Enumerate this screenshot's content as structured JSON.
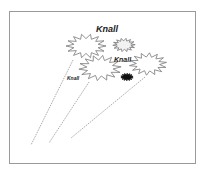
{
  "diagram": {
    "labels": [
      {
        "text": "Knall",
        "x": 96,
        "y": 24,
        "size": 9
      },
      {
        "text": "Knall",
        "x": 114,
        "y": 56,
        "size": 7
      },
      {
        "text": "Knall",
        "x": 67,
        "y": 75,
        "size": 5
      }
    ],
    "bursts": [
      {
        "cx": 86,
        "cy": 46,
        "r": 16,
        "fill": "#ffffff"
      },
      {
        "cx": 124,
        "cy": 45,
        "r": 9,
        "fill": "#f2f2f2"
      },
      {
        "cx": 100,
        "cy": 68,
        "r": 17,
        "fill": "#ffffff"
      },
      {
        "cx": 148,
        "cy": 64,
        "r": 15,
        "fill": "#ffffff"
      },
      {
        "cx": 127,
        "cy": 77,
        "r": 5,
        "fill": "#111111"
      }
    ],
    "trails": [
      {
        "x1": 73,
        "y1": 60,
        "x2": 31,
        "y2": 145
      },
      {
        "x1": 89,
        "y1": 82,
        "x2": 49,
        "y2": 143
      },
      {
        "x1": 145,
        "y1": 77,
        "x2": 71,
        "y2": 138
      }
    ],
    "colors": {
      "border": "#9a9a9a",
      "stroke": "#777777",
      "trail": "#aaaaaa"
    }
  }
}
